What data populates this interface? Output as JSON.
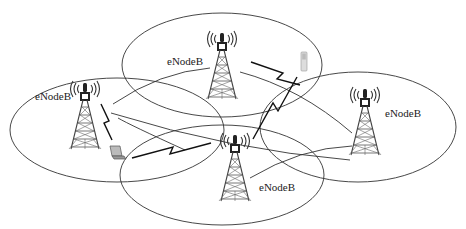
{
  "diagram": {
    "type": "LTE cellular network topology",
    "colors": {
      "stroke": "#333333",
      "tower": "#444444",
      "background": "#ffffff"
    },
    "cells": [
      {
        "id": "left",
        "label": "eNodeB",
        "ellipse": {
          "cx": 117,
          "cy": 130,
          "rx": 107,
          "ry": 52
        }
      },
      {
        "id": "top",
        "label": "eNodeB",
        "ellipse": {
          "cx": 222,
          "cy": 65,
          "rx": 100,
          "ry": 52
        }
      },
      {
        "id": "right",
        "label": "eNodeB",
        "ellipse": {
          "cx": 358,
          "cy": 127,
          "rx": 98,
          "ry": 55
        }
      },
      {
        "id": "bottom",
        "label": "eNodeB",
        "ellipse": {
          "cx": 222,
          "cy": 175,
          "rx": 102,
          "ry": 50
        }
      }
    ],
    "devices": [
      {
        "id": "laptop",
        "icon": "laptop-icon",
        "x": 110,
        "y": 146
      },
      {
        "id": "phone",
        "icon": "mobile-phone-icon",
        "x": 300,
        "y": 48
      }
    ],
    "links": [
      {
        "type": "wireless",
        "from": "left-tower",
        "to": "laptop"
      },
      {
        "type": "wireless",
        "from": "top-tower",
        "to": "phone"
      },
      {
        "type": "wireless",
        "from": "bottom-tower",
        "to": "left-cell"
      },
      {
        "type": "wireless",
        "from": "bottom-tower",
        "to": "phone"
      },
      {
        "type": "wired",
        "from": "left-tower",
        "to": "top-tower"
      },
      {
        "type": "wired",
        "from": "left-tower",
        "to": "right-tower"
      },
      {
        "type": "wired",
        "from": "top-tower",
        "to": "right-tower"
      },
      {
        "type": "wired",
        "from": "bottom-tower",
        "to": "right-tower"
      }
    ]
  }
}
